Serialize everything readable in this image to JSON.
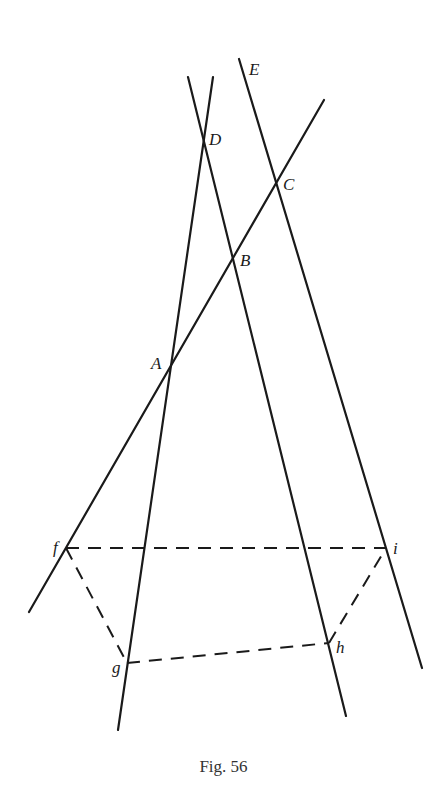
{
  "figure": {
    "caption": "Fig. 56",
    "points": {
      "A": {
        "label": "A",
        "x": 170,
        "y": 368
      },
      "B": {
        "label": "B",
        "x": 233,
        "y": 258
      },
      "C": {
        "label": "C",
        "x": 277,
        "y": 183
      },
      "D": {
        "label": "D",
        "x": 203,
        "y": 146
      },
      "E": {
        "label": "E",
        "x": 239,
        "y": 59
      },
      "f": {
        "label": "f",
        "x": 66,
        "y": 548
      },
      "g": {
        "label": "g",
        "x": 127,
        "y": 663
      },
      "h": {
        "label": "h",
        "x": 329,
        "y": 643
      },
      "i": {
        "label": "i",
        "x": 386,
        "y": 548
      }
    },
    "solid_lines": [
      {
        "name": "line-AD",
        "x1": 213,
        "y1": 77,
        "x2": 118,
        "y2": 730
      },
      {
        "name": "line-DB",
        "x1": 188,
        "y1": 77,
        "x2": 346,
        "y2": 716
      },
      {
        "name": "line-EC",
        "x1": 239,
        "y1": 59,
        "x2": 422,
        "y2": 668
      },
      {
        "name": "line-ABC",
        "x1": 29,
        "y1": 612,
        "x2": 324,
        "y2": 100
      }
    ],
    "dashed_lines": [
      {
        "name": "dashed-fi",
        "from": "f",
        "to": "i"
      },
      {
        "name": "dashed-fg",
        "from": "f",
        "to": "g"
      },
      {
        "name": "dashed-gh",
        "from": "g",
        "to": "h"
      },
      {
        "name": "dashed-hi",
        "from": "h",
        "to": "i"
      }
    ],
    "stroke_color": "#1a1a1a"
  }
}
